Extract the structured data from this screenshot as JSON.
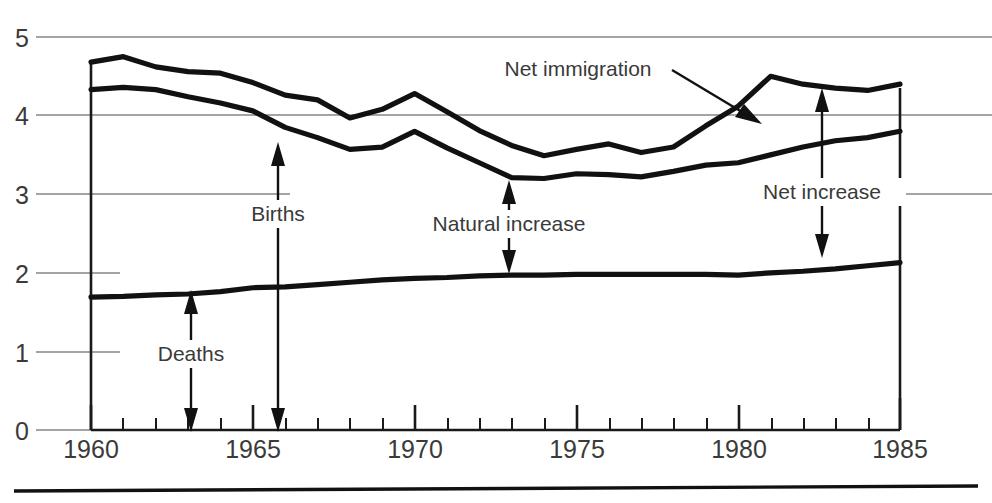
{
  "chart_data": {
    "type": "line",
    "title": "",
    "subtitle": "",
    "xlabel": "",
    "ylabel": "",
    "xlim": [
      1960,
      1985
    ],
    "ylim": [
      0,
      5
    ],
    "grid": true,
    "legend_position": "inline-annotations",
    "y_ticks": [
      "0",
      "1",
      "2",
      "3",
      "4",
      "5"
    ],
    "y_tick_values": [
      0,
      1,
      2,
      3,
      4,
      5
    ],
    "x_ticks": [
      "1960",
      "1965",
      "1970",
      "1975",
      "1980",
      "1985"
    ],
    "x_tick_values": [
      1960,
      1965,
      1970,
      1975,
      1980,
      1985
    ],
    "x_minor_step": 1,
    "x": [
      1960,
      1961,
      1962,
      1963,
      1964,
      1965,
      1966,
      1967,
      1968,
      1969,
      1970,
      1971,
      1972,
      1973,
      1974,
      1975,
      1976,
      1977,
      1978,
      1979,
      1980,
      1981,
      1982,
      1983,
      1984,
      1985
    ],
    "series": [
      {
        "name": "Total population increase (births + net immigration)",
        "values": [
          4.68,
          4.75,
          4.62,
          4.56,
          4.54,
          4.42,
          4.26,
          4.2,
          3.97,
          4.08,
          4.28,
          4.05,
          3.81,
          3.62,
          3.49,
          3.57,
          3.64,
          3.53,
          3.6,
          3.87,
          4.12,
          4.5,
          4.4,
          4.35,
          4.32,
          4.4
        ]
      },
      {
        "name": "Births",
        "values": [
          4.33,
          4.36,
          4.33,
          4.24,
          4.16,
          4.06,
          3.85,
          3.72,
          3.57,
          3.6,
          3.8,
          3.59,
          3.4,
          3.21,
          3.2,
          3.26,
          3.25,
          3.22,
          3.29,
          3.37,
          3.4,
          3.5,
          3.6,
          3.68,
          3.72,
          3.8
        ]
      },
      {
        "name": "Deaths",
        "values": [
          1.69,
          1.7,
          1.72,
          1.73,
          1.76,
          1.81,
          1.82,
          1.85,
          1.88,
          1.91,
          1.93,
          1.94,
          1.96,
          1.97,
          1.97,
          1.98,
          1.98,
          1.98,
          1.98,
          1.98,
          1.97,
          2.0,
          2.02,
          2.05,
          2.09,
          2.13
        ]
      }
    ],
    "annotations": [
      {
        "label": "Net immigration",
        "x": 1972.8,
        "kind": "pointer-arrow",
        "target_x": 1979.6
      },
      {
        "label": "Births",
        "x": 1965.9,
        "kind": "double-arrow-to-axis"
      },
      {
        "label": "Deaths",
        "x": 1963.0,
        "kind": "double-arrow-to-axis"
      },
      {
        "label": "Natural increase",
        "x": 1973.0,
        "kind": "double-arrow-between-lines"
      },
      {
        "label": "Net increase",
        "x": 1981.9,
        "kind": "double-arrow-between-lines"
      }
    ]
  },
  "colors": {
    "line": "#111111",
    "grid": "#4a4a4a",
    "text": "#3a3a3a",
    "background": "#ffffff"
  }
}
